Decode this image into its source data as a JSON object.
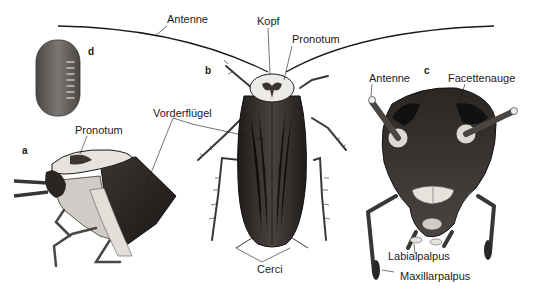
{
  "figure": {
    "panels": {
      "a": "a",
      "b": "b",
      "c": "c",
      "d": "d"
    },
    "labels": {
      "antenne_top": "Antenne",
      "kopf": "Kopf",
      "pronotum_b": "Pronotum",
      "vorderfluegel": "Vorderflügel",
      "pronotum_a": "Pronotum",
      "cerci": "Cerci",
      "antenne_c": "Antenne",
      "facettenauge": "Facettenauge",
      "labialpalpus": "Labialpalpus",
      "maxillarpalpus": "Maxillarpalpus"
    },
    "colors": {
      "ink": "#1a1a1a",
      "wing_dark": "#2e2a28",
      "wing_mid": "#4a4440",
      "pronotum_light": "#e8e6e2",
      "ootheca": "#6a6664",
      "background": "#ffffff"
    }
  }
}
